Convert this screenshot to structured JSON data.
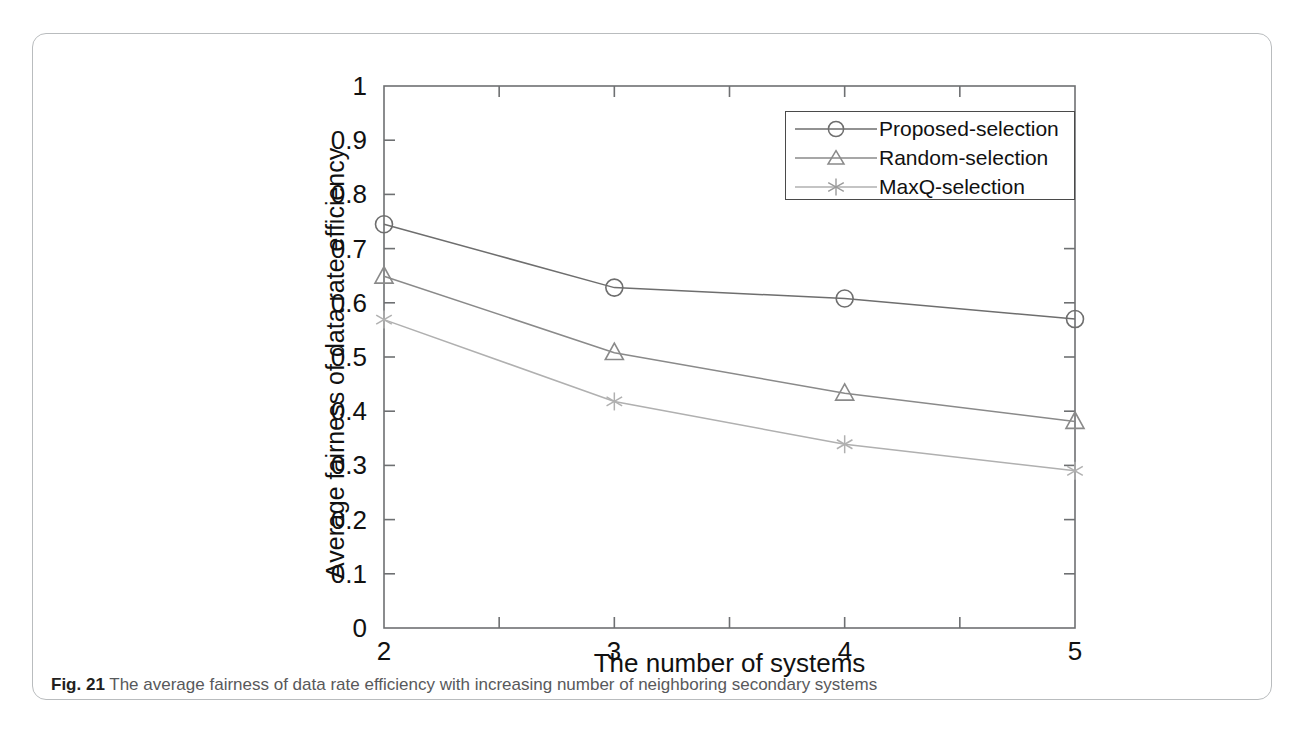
{
  "figure": {
    "caption_number": "Fig. 21",
    "caption_text": "The average fairness of data rate efficiency with increasing number of neighboring secondary systems"
  },
  "chart_data": {
    "type": "line",
    "title": "",
    "xlabel": "The number of systems",
    "ylabel": "Average fairness of data rate efficiency",
    "x": [
      2,
      3,
      4,
      5
    ],
    "xlim": [
      2,
      5
    ],
    "ylim": [
      0,
      1
    ],
    "xticks": [
      2,
      3,
      4,
      5
    ],
    "xtick_labels": [
      "2",
      "3",
      "4",
      "5"
    ],
    "x_minor_ticks": [
      2.5,
      3.5,
      4.5
    ],
    "yticks": [
      0,
      0.1,
      0.2,
      0.3,
      0.4,
      0.5,
      0.6,
      0.7,
      0.8,
      0.9,
      1
    ],
    "ytick_labels": [
      "0",
      "0.1",
      "0.2",
      "0.3",
      "0.4",
      "0.5",
      "0.6",
      "0.7",
      "0.8",
      "0.9",
      "1"
    ],
    "grid": false,
    "legend_position": "upper right",
    "series": [
      {
        "name": "Proposed-selection",
        "marker": "circle",
        "color": "#6e6e6e",
        "values": [
          0.745,
          0.628,
          0.608,
          0.57
        ]
      },
      {
        "name": "Random-selection",
        "marker": "triangle",
        "color": "#8a8a8a",
        "values": [
          0.649,
          0.508,
          0.433,
          0.381
        ]
      },
      {
        "name": "MaxQ-selection",
        "marker": "asterisk",
        "color": "#b0b0b0",
        "values": [
          0.569,
          0.418,
          0.339,
          0.29
        ]
      }
    ]
  },
  "axes": {
    "frame_color": "#6e7072"
  }
}
